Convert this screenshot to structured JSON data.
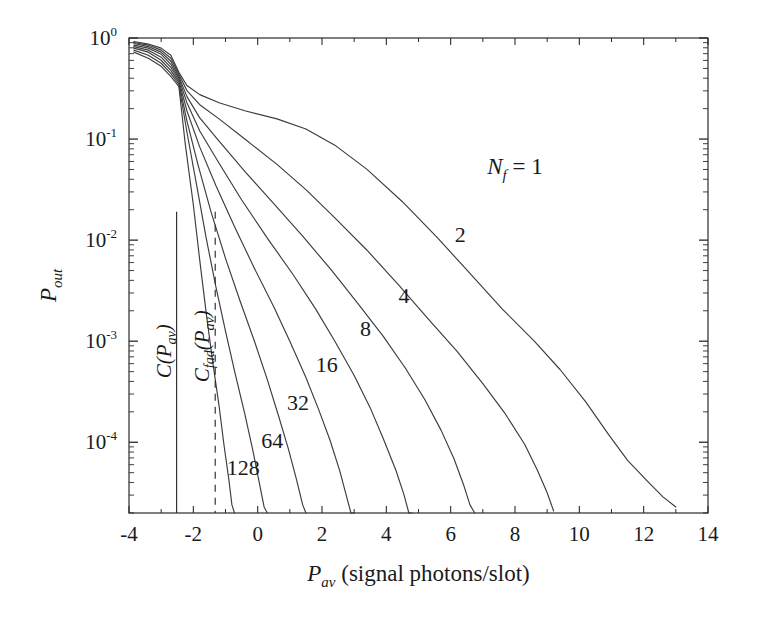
{
  "chart_data": {
    "type": "line",
    "title": "",
    "xlabel": "P_av (signal photons/slot)",
    "ylabel": "P_out",
    "xlabel_main": "P",
    "xlabel_sub": "av",
    "xlabel_rest": " (signal photons/slot)",
    "ylabel_main": "P",
    "ylabel_sub": "out",
    "xlim": [
      -4,
      14
    ],
    "ylim_log10": [
      -4.7,
      0
    ],
    "yscale": "log",
    "xscale": "linear",
    "grid": false,
    "legend_position": "inline-curve-labels",
    "xticks": [
      -4,
      -2,
      0,
      2,
      4,
      6,
      8,
      10,
      12,
      14
    ],
    "xtick_labels": [
      "-4",
      "-2",
      "0",
      "2",
      "4",
      "6",
      "8",
      "10",
      "12",
      "14"
    ],
    "yticks_log10": [
      0,
      -1,
      -2,
      -3,
      -4
    ],
    "ytick_labels": [
      "10",
      "10",
      "10",
      "10",
      "10"
    ],
    "ytick_exponents": [
      "0",
      "-1",
      "-2",
      "-3",
      "-4"
    ],
    "series_parameter_name": "N_f",
    "series": [
      {
        "name": "1",
        "label": "N_f = 1",
        "label_main": "N",
        "label_sub": "f",
        "label_rest": " = 1",
        "label_x": 8.0,
        "label_y_log10": -1.35,
        "points": [
          [
            -3.85,
            -0.035
          ],
          [
            -3.4,
            -0.06
          ],
          [
            -3.0,
            -0.1
          ],
          [
            -2.7,
            -0.17
          ],
          [
            -2.45,
            -0.34
          ],
          [
            -2.2,
            -0.47
          ],
          [
            -1.8,
            -0.56
          ],
          [
            -1.2,
            -0.64
          ],
          [
            -0.4,
            -0.72
          ],
          [
            0.6,
            -0.8
          ],
          [
            1.5,
            -0.9
          ],
          [
            2.4,
            -1.06
          ],
          [
            3.4,
            -1.3
          ],
          [
            4.5,
            -1.62
          ],
          [
            5.6,
            -1.98
          ],
          [
            6.6,
            -2.33
          ],
          [
            7.6,
            -2.68
          ],
          [
            8.6,
            -3.0
          ],
          [
            9.4,
            -3.28
          ],
          [
            10.2,
            -3.6
          ],
          [
            10.9,
            -3.92
          ],
          [
            11.5,
            -4.18
          ],
          [
            12.1,
            -4.38
          ],
          [
            12.6,
            -4.54
          ],
          [
            13.0,
            -4.64
          ]
        ]
      },
      {
        "name": "2",
        "label": "2",
        "label_x": 6.3,
        "label_y_log10": -2.02,
        "points": [
          [
            -3.85,
            -0.045
          ],
          [
            -3.4,
            -0.07
          ],
          [
            -3.0,
            -0.12
          ],
          [
            -2.7,
            -0.2
          ],
          [
            -2.45,
            -0.36
          ],
          [
            -2.2,
            -0.52
          ],
          [
            -1.8,
            -0.66
          ],
          [
            -1.2,
            -0.8
          ],
          [
            -0.4,
            -1.0
          ],
          [
            0.6,
            -1.25
          ],
          [
            1.5,
            -1.5
          ],
          [
            2.4,
            -1.78
          ],
          [
            3.4,
            -2.1
          ],
          [
            4.4,
            -2.45
          ],
          [
            5.3,
            -2.78
          ],
          [
            6.2,
            -3.1
          ],
          [
            7.0,
            -3.42
          ],
          [
            7.7,
            -3.72
          ],
          [
            8.3,
            -4.02
          ],
          [
            8.7,
            -4.28
          ],
          [
            9.0,
            -4.5
          ],
          [
            9.2,
            -4.68
          ]
        ]
      },
      {
        "name": "4",
        "label": "4",
        "label_x": 4.55,
        "label_y_log10": -2.62,
        "points": [
          [
            -3.85,
            -0.055
          ],
          [
            -3.4,
            -0.085
          ],
          [
            -3.0,
            -0.14
          ],
          [
            -2.7,
            -0.23
          ],
          [
            -2.45,
            -0.38
          ],
          [
            -2.2,
            -0.58
          ],
          [
            -1.8,
            -0.79
          ],
          [
            -1.2,
            -1.02
          ],
          [
            -0.4,
            -1.32
          ],
          [
            0.5,
            -1.64
          ],
          [
            1.4,
            -1.96
          ],
          [
            2.3,
            -2.3
          ],
          [
            3.1,
            -2.62
          ],
          [
            3.9,
            -2.95
          ],
          [
            4.6,
            -3.27
          ],
          [
            5.2,
            -3.58
          ],
          [
            5.7,
            -3.88
          ],
          [
            6.1,
            -4.16
          ],
          [
            6.4,
            -4.42
          ],
          [
            6.6,
            -4.62
          ],
          [
            6.75,
            -4.72
          ]
        ]
      },
      {
        "name": "8",
        "label": "8",
        "label_x": 3.35,
        "label_y_log10": -2.95,
        "points": [
          [
            -3.85,
            -0.07
          ],
          [
            -3.4,
            -0.1
          ],
          [
            -3.0,
            -0.16
          ],
          [
            -2.7,
            -0.26
          ],
          [
            -2.45,
            -0.4
          ],
          [
            -2.2,
            -0.64
          ],
          [
            -1.8,
            -0.92
          ],
          [
            -1.2,
            -1.24
          ],
          [
            -0.5,
            -1.6
          ],
          [
            0.3,
            -1.98
          ],
          [
            1.1,
            -2.34
          ],
          [
            1.8,
            -2.68
          ],
          [
            2.4,
            -3.0
          ],
          [
            3.0,
            -3.34
          ],
          [
            3.5,
            -3.66
          ],
          [
            3.9,
            -3.96
          ],
          [
            4.3,
            -4.28
          ],
          [
            4.55,
            -4.52
          ],
          [
            4.7,
            -4.7
          ],
          [
            4.8,
            -4.78
          ]
        ]
      },
      {
        "name": "16",
        "label": "16",
        "label_x": 2.15,
        "label_y_log10": -3.3,
        "points": [
          [
            -3.85,
            -0.085
          ],
          [
            -3.4,
            -0.12
          ],
          [
            -3.0,
            -0.19
          ],
          [
            -2.7,
            -0.29
          ],
          [
            -2.45,
            -0.42
          ],
          [
            -2.2,
            -0.72
          ],
          [
            -1.8,
            -1.08
          ],
          [
            -1.3,
            -1.46
          ],
          [
            -0.7,
            -1.88
          ],
          [
            -0.1,
            -2.28
          ],
          [
            0.5,
            -2.66
          ],
          [
            1.0,
            -3.0
          ],
          [
            1.5,
            -3.36
          ],
          [
            1.9,
            -3.68
          ],
          [
            2.25,
            -3.98
          ],
          [
            2.55,
            -4.28
          ],
          [
            2.75,
            -4.52
          ],
          [
            2.9,
            -4.7
          ],
          [
            3.0,
            -4.8
          ]
        ]
      },
      {
        "name": "32",
        "label": "32",
        "label_x": 1.25,
        "label_y_log10": -3.68,
        "points": [
          [
            -3.85,
            -0.1
          ],
          [
            -3.4,
            -0.14
          ],
          [
            -3.0,
            -0.22
          ],
          [
            -2.7,
            -0.32
          ],
          [
            -2.45,
            -0.44
          ],
          [
            -2.2,
            -0.82
          ],
          [
            -1.85,
            -1.26
          ],
          [
            -1.45,
            -1.72
          ],
          [
            -1.0,
            -2.18
          ],
          [
            -0.55,
            -2.6
          ],
          [
            -0.1,
            -3.0
          ],
          [
            0.3,
            -3.38
          ],
          [
            0.65,
            -3.74
          ],
          [
            0.95,
            -4.06
          ],
          [
            1.2,
            -4.36
          ],
          [
            1.4,
            -4.62
          ],
          [
            1.5,
            -4.78
          ]
        ]
      },
      {
        "name": "64",
        "label": "64",
        "label_x": 0.45,
        "label_y_log10": -4.06,
        "points": [
          [
            -3.85,
            -0.12
          ],
          [
            -3.4,
            -0.17
          ],
          [
            -3.0,
            -0.25
          ],
          [
            -2.7,
            -0.35
          ],
          [
            -2.45,
            -0.46
          ],
          [
            -2.2,
            -0.93
          ],
          [
            -1.9,
            -1.45
          ],
          [
            -1.6,
            -1.98
          ],
          [
            -1.3,
            -2.46
          ],
          [
            -1.0,
            -2.9
          ],
          [
            -0.7,
            -3.32
          ],
          [
            -0.4,
            -3.72
          ],
          [
            -0.15,
            -4.08
          ],
          [
            0.05,
            -4.4
          ],
          [
            0.2,
            -4.64
          ],
          [
            0.3,
            -4.8
          ]
        ]
      },
      {
        "name": "128",
        "label": "128",
        "label_x": -0.45,
        "label_y_log10": -4.32,
        "points": [
          [
            -3.85,
            -0.14
          ],
          [
            -3.4,
            -0.2
          ],
          [
            -3.0,
            -0.28
          ],
          [
            -2.7,
            -0.38
          ],
          [
            -2.45,
            -0.48
          ],
          [
            -2.25,
            -1.05
          ],
          [
            -2.0,
            -1.65
          ],
          [
            -1.8,
            -2.2
          ],
          [
            -1.6,
            -2.72
          ],
          [
            -1.4,
            -3.2
          ],
          [
            -1.2,
            -3.64
          ],
          [
            -1.05,
            -4.02
          ],
          [
            -0.9,
            -4.36
          ],
          [
            -0.8,
            -4.62
          ],
          [
            -0.72,
            -4.78
          ]
        ]
      }
    ],
    "annotations": [
      {
        "name": "capacity-line",
        "type": "vline",
        "style": "solid",
        "x": -2.52,
        "label": "C(P_av)",
        "label_main": "C(P",
        "label_sub": "av",
        "label_rest": ")",
        "label_y_log10": -3.1
      },
      {
        "name": "fading-capacity-line",
        "type": "vline",
        "style": "dashed",
        "x": -1.32,
        "label": "C_fad(P_av)",
        "label_main": "C",
        "label_sub1": "fad",
        "label_mid": "(P",
        "label_sub2": "av",
        "label_rest": ")",
        "label_y_log10": -3.05
      }
    ],
    "colors": {
      "curve": "#3c3c3c",
      "axis": "#2b2b2b",
      "text": "#1a1a1a",
      "background": "#ffffff"
    }
  }
}
